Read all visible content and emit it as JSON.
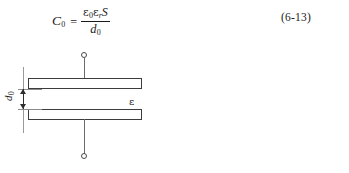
{
  "document": {
    "background_color": "#ffffff",
    "ink_color": "#1a1a1a"
  },
  "formula": {
    "lhs_symbol": "C",
    "lhs_subscript": "0",
    "equals": "=",
    "numerator_eps0": "ε",
    "numerator_eps0_sub": "0",
    "numerator_epsr": "ε",
    "numerator_epsr_sub": "r",
    "numerator_area": "S",
    "denominator_symbol": "d",
    "denominator_subscript": "0",
    "plain_text": "C0 = ε0εrS / d0"
  },
  "equation_number": {
    "label": "(6-13)",
    "chapter": "6",
    "index": "13"
  },
  "figure": {
    "type": "parallel-plate-capacitor",
    "plates": [
      {
        "id": "top",
        "label": ""
      },
      {
        "id": "bottom",
        "label": ""
      }
    ],
    "gap_dimension": {
      "symbol": "d",
      "subscript": "0",
      "orientation": "vertical-rotated"
    },
    "dielectric": {
      "symbol": "ε"
    },
    "terminals": [
      {
        "id": "top-terminal",
        "shape": "circle"
      },
      {
        "id": "bottom-terminal",
        "shape": "circle"
      }
    ],
    "colors": {
      "plate_stroke": "#3c3c3c",
      "lead_stroke": "#6a6a6a",
      "dimension_stroke": "#2e2e2e",
      "witness_stroke": "#9a9a9a"
    }
  }
}
